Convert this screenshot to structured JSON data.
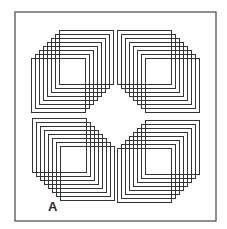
{
  "figure": {
    "label": "A",
    "stroke_color": "#333333",
    "frame_color": "#555555",
    "background": "#ffffff",
    "frame": {
      "x": 15,
      "y": 12,
      "width": 201,
      "height": 209
    },
    "square_size": 54,
    "step": 4,
    "count_per_group": 8,
    "groups": [
      {
        "name": "top-left",
        "start": [
          31,
          58
        ],
        "direction": [
          4,
          -4
        ]
      },
      {
        "name": "top-right",
        "start": [
          117,
          30
        ],
        "direction": [
          4,
          4
        ]
      },
      {
        "name": "bottom-left",
        "start": [
          32,
          118
        ],
        "direction": [
          4,
          4
        ]
      },
      {
        "name": "bottom-right",
        "start": [
          117,
          148
        ],
        "direction": [
          4,
          -4
        ]
      }
    ]
  }
}
